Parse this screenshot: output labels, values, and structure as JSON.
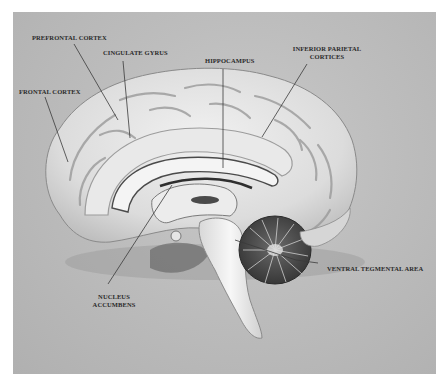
{
  "figure": {
    "colors": {
      "background": "#b8b8b8",
      "brain_tissue": "#e6e6e6",
      "brainstem": "#f0f0f0",
      "cerebellum": "#555555",
      "label_text": "#2a2a2a",
      "leader_line": "#3a3a3a"
    },
    "labels": [
      {
        "id": "prefrontal-cortex",
        "text": "PREFRONTAL CORTEX"
      },
      {
        "id": "cingulate-gyrus",
        "text": "CINGULATE GYRUS"
      },
      {
        "id": "hippocampus",
        "text": "HIPPOCAMPUS"
      },
      {
        "id": "inferior-parietal-cortices",
        "text_line1": "INFERIOR PARIETAL",
        "text_line2": "CORTICES"
      },
      {
        "id": "frontal-cortex",
        "text": "FRONTAL CORTEX"
      },
      {
        "id": "nucleus-accumbens",
        "text_line1": "NUCLEUS",
        "text_line2": "ACCUMBENS"
      },
      {
        "id": "ventral-tegmental-area",
        "text": "VENTRAL TEGMENTAL AREA"
      }
    ]
  }
}
